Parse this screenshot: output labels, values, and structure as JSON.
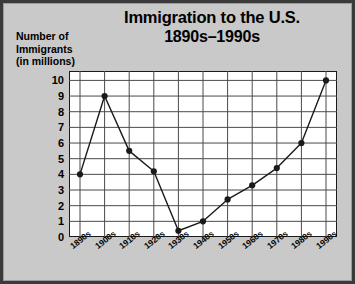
{
  "chart_data": {
    "type": "line",
    "title": "Immigration to the U.S.",
    "subtitle": "1890s–1990s",
    "title_lines": [
      "Immigration to the U.S.",
      "1890s–1990s"
    ],
    "ylabel_lines": [
      "Number of",
      "Immigrants",
      "(in millions)"
    ],
    "ylabel": "Number of Immigrants (in millions)",
    "xlabel": "",
    "categories": [
      "1890s",
      "1900s",
      "1910s",
      "1920s",
      "1930s",
      "1940s",
      "1950s",
      "1960s",
      "1970s",
      "1980s",
      "1990s"
    ],
    "values": [
      4.0,
      9.0,
      5.5,
      4.2,
      0.4,
      1.0,
      2.4,
      3.3,
      4.4,
      6.0,
      10.0
    ],
    "yticks": [
      0,
      1,
      2,
      3,
      4,
      5,
      6,
      7,
      8,
      9,
      10
    ],
    "ytick_labels": [
      "0",
      "1",
      "2",
      "3",
      "4",
      "5",
      "6",
      "7",
      "8",
      "9",
      "10"
    ],
    "ylim": [
      0,
      10.6
    ],
    "grid": true,
    "legend": false,
    "marker": "filled-circle",
    "line_color": "#1a1a1a",
    "marker_color": "#1a1a1a",
    "grid_color": "#4a4a4a",
    "plot_background": "#ffffff",
    "page_background": "#c9c9c9",
    "frame_color": "#3a3a3a",
    "text_color": "#000000"
  }
}
